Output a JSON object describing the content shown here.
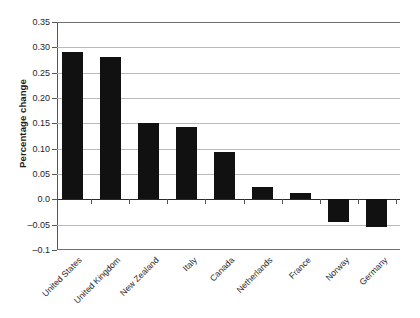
{
  "chart_data": {
    "type": "bar",
    "title": "",
    "xlabel": "",
    "ylabel": "Percentage change",
    "categories": [
      "United States",
      "United Kingdom",
      "New Zealand",
      "Italy",
      "Canada",
      "Netherlands",
      "France",
      "Norway",
      "Germany"
    ],
    "values": [
      0.29,
      0.281,
      0.151,
      0.142,
      0.093,
      0.024,
      0.013,
      -0.044,
      -0.054
    ],
    "ylim": [
      -0.1,
      0.35
    ],
    "ytick_values": [
      0.35,
      0.3,
      0.25,
      0.2,
      0.15,
      0.1,
      0.05,
      0.0,
      -0.05,
      -0.1
    ],
    "ytick_labels": [
      "0.35",
      "0.30",
      "0.25",
      "0.20",
      "0.15",
      "0.10",
      "0.05",
      "0.0",
      "-0.05",
      "-0.1"
    ],
    "grid": true,
    "legend": false,
    "bar_color": "#111111",
    "gridline_color": "#b9b9b9",
    "axis_color": "#555555",
    "background_color": "#ffffff",
    "xtick_label_rotation": -45
  }
}
